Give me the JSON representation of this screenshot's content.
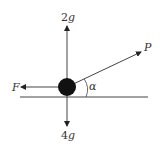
{
  "diagram": {
    "type": "force-diagram",
    "colors": {
      "line": "#444444",
      "particle": "#111111",
      "text": "#333333",
      "background": "#ffffff"
    },
    "forces": {
      "up": {
        "label_coef": "2",
        "label_var": "g",
        "direction": "up"
      },
      "down": {
        "label_coef": "4",
        "label_var": "g",
        "direction": "down"
      },
      "left": {
        "label": "F",
        "direction": "left"
      },
      "angled": {
        "label": "P",
        "direction": "up-right at angle alpha above horizontal"
      }
    },
    "angle": {
      "label": "α"
    },
    "surface": {
      "type": "horizontal line"
    }
  }
}
